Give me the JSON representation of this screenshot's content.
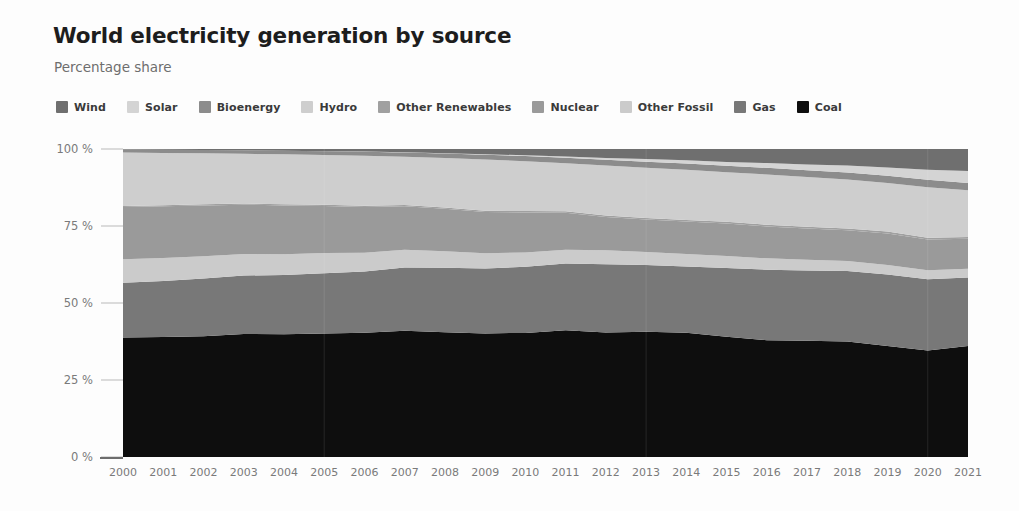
{
  "header": {
    "title": "World electricity generation by source",
    "subtitle": "Percentage share"
  },
  "legend": {
    "position": "top",
    "items": [
      {
        "label": "Wind",
        "color": "#6f6f6f",
        "swatch_name": "legend-swatch-wind"
      },
      {
        "label": "Solar",
        "color": "#d4d4d4",
        "swatch_name": "legend-swatch-solar"
      },
      {
        "label": "Bioenergy",
        "color": "#8c8c8c",
        "swatch_name": "legend-swatch-bioenergy"
      },
      {
        "label": "Hydro",
        "color": "#cecece",
        "swatch_name": "legend-swatch-hydro"
      },
      {
        "label": "Other Renewables",
        "color": "#a0a0a0",
        "swatch_name": "legend-swatch-other-renewables"
      },
      {
        "label": "Nuclear",
        "color": "#9a9a9a",
        "swatch_name": "legend-swatch-nuclear"
      },
      {
        "label": "Other Fossil",
        "color": "#cbcbcb",
        "swatch_name": "legend-swatch-other-fossil"
      },
      {
        "label": "Gas",
        "color": "#787878",
        "swatch_name": "legend-swatch-gas"
      },
      {
        "label": "Coal",
        "color": "#0e0e0e",
        "swatch_name": "legend-swatch-coal"
      }
    ]
  },
  "axes": {
    "y_ticks": [
      "0 %",
      "25 %",
      "50 %",
      "75 %",
      "100 %"
    ],
    "y_tick_values": [
      0,
      25,
      50,
      75,
      100
    ],
    "x_ticks": [
      "2000",
      "2001",
      "2002",
      "2003",
      "2004",
      "2005",
      "2006",
      "2007",
      "2008",
      "2009",
      "2010",
      "2011",
      "2012",
      "2013",
      "2014",
      "2015",
      "2016",
      "2017",
      "2018",
      "2019",
      "2020",
      "2021"
    ]
  },
  "chart_data": {
    "type": "area",
    "stacked": true,
    "normalized": true,
    "title": "World electricity generation by source",
    "subtitle": "Percentage share",
    "xlabel": "",
    "ylabel": "Percentage share",
    "ylim": [
      0,
      100
    ],
    "xlim": [
      2000,
      2021
    ],
    "grid": false,
    "legend_position": "top",
    "x": [
      2000,
      2001,
      2002,
      2003,
      2004,
      2005,
      2006,
      2007,
      2008,
      2009,
      2010,
      2011,
      2012,
      2013,
      2014,
      2015,
      2016,
      2017,
      2018,
      2019,
      2020,
      2021
    ],
    "stack_order_bottom_to_top": [
      "Coal",
      "Gas",
      "Other Fossil",
      "Nuclear",
      "Other Renewables",
      "Hydro",
      "Bioenergy",
      "Solar",
      "Wind"
    ],
    "series": [
      {
        "name": "Coal",
        "color": "#0e0e0e",
        "values": [
          38.5,
          38.6,
          38.9,
          39.6,
          39.8,
          40.2,
          40.5,
          41.2,
          40.8,
          40.2,
          40.3,
          41.1,
          40.5,
          41.0,
          40.6,
          39.2,
          38.1,
          38.1,
          38.0,
          36.5,
          35.0,
          36.2
        ]
      },
      {
        "name": "Gas",
        "color": "#787878",
        "values": [
          17.6,
          18.0,
          18.6,
          18.8,
          19.2,
          19.6,
          20.0,
          20.6,
          21.0,
          21.1,
          21.5,
          21.6,
          22.2,
          21.8,
          21.6,
          22.4,
          23.0,
          23.0,
          23.1,
          23.5,
          23.4,
          22.4
        ]
      },
      {
        "name": "Other Fossil",
        "color": "#cbcbcb",
        "values": [
          7.6,
          7.4,
          7.1,
          6.9,
          6.8,
          6.6,
          6.1,
          5.8,
          5.4,
          5.0,
          4.6,
          4.5,
          4.6,
          4.3,
          4.1,
          3.9,
          3.7,
          3.5,
          3.3,
          3.1,
          2.9,
          2.8
        ]
      },
      {
        "name": "Nuclear",
        "color": "#9a9a9a",
        "values": [
          16.8,
          16.6,
          16.4,
          15.9,
          15.8,
          15.3,
          14.9,
          14.2,
          13.9,
          13.4,
          13.0,
          12.0,
          10.8,
          10.6,
          10.6,
          10.6,
          10.4,
          10.3,
          10.1,
          10.4,
          10.1,
          9.8
        ]
      },
      {
        "name": "Other Renewables",
        "color": "#a0a0a0",
        "values": [
          0.33,
          0.34,
          0.35,
          0.36,
          0.37,
          0.38,
          0.39,
          0.4,
          0.42,
          0.44,
          0.45,
          0.46,
          0.48,
          0.5,
          0.52,
          0.54,
          0.55,
          0.57,
          0.58,
          0.59,
          0.6,
          0.62
        ]
      },
      {
        "name": "Hydro",
        "color": "#cecece",
        "values": [
          17.2,
          16.8,
          16.4,
          16.0,
          16.2,
          16.2,
          16.3,
          15.8,
          16.2,
          16.6,
          16.2,
          15.6,
          16.3,
          16.5,
          16.4,
          16.2,
          16.4,
          16.3,
          16.1,
          16.0,
          16.6,
          15.2
        ]
      },
      {
        "name": "Bioenergy",
        "color": "#8c8c8c",
        "values": [
          0.95,
          1.0,
          1.05,
          1.1,
          1.15,
          1.22,
          1.3,
          1.38,
          1.45,
          1.58,
          1.65,
          1.75,
          1.85,
          1.95,
          2.05,
          2.1,
          2.15,
          2.2,
          2.3,
          2.35,
          2.45,
          2.4
        ]
      },
      {
        "name": "Solar",
        "color": "#d4d4d4",
        "values": [
          0.01,
          0.01,
          0.02,
          0.02,
          0.03,
          0.04,
          0.06,
          0.08,
          0.12,
          0.17,
          0.25,
          0.4,
          0.6,
          0.85,
          1.05,
          1.25,
          1.55,
          1.9,
          2.3,
          2.75,
          3.3,
          3.9
        ]
      },
      {
        "name": "Wind",
        "color": "#6f6f6f",
        "values": [
          0.18,
          0.25,
          0.33,
          0.42,
          0.55,
          0.7,
          0.85,
          1.05,
          1.35,
          1.7,
          2.05,
          2.45,
          2.9,
          3.3,
          3.7,
          4.2,
          4.6,
          5.05,
          5.45,
          6.05,
          6.8,
          7.2
        ]
      }
    ]
  }
}
